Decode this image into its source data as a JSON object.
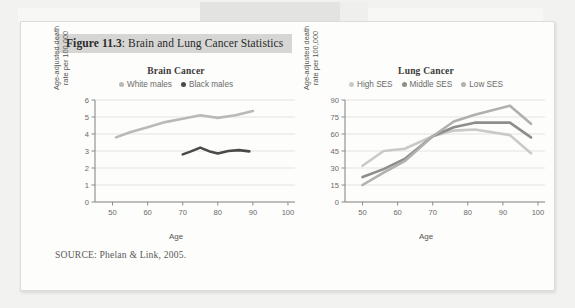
{
  "figure": {
    "label": "Figure 11.3",
    "title_prefix": "Figure 11.3",
    "title_rest": ": Brain and Lung Cancer Statistics",
    "source": "SOURCE: Phelan & Link, 2005."
  },
  "colors": {
    "white_males": "#b9b9b7",
    "black_males": "#4a4a4a",
    "high_ses": "#c9c9c6",
    "middle_ses": "#8d8d8b",
    "low_ses": "#b0b0ad",
    "grid": "#e3e3e0",
    "axis": "#8a8a86",
    "title_band": "#d6d6d4"
  },
  "charts": [
    {
      "id": "brain",
      "title": "Brain Cancer",
      "xlabel": "Age",
      "ylabel_line1": "Age-adjusted death",
      "ylabel_line2": "rate per 100,000",
      "xticks": [
        50,
        60,
        70,
        80,
        90,
        100
      ],
      "yticks": [
        0,
        1,
        2,
        3,
        4,
        5,
        6
      ],
      "xlim": [
        45,
        102
      ],
      "ylim": [
        0,
        6
      ],
      "legend": [
        {
          "label": "White males",
          "color": "#b9b9b7"
        },
        {
          "label": "Black males",
          "color": "#4a4a4a"
        }
      ]
    },
    {
      "id": "lung",
      "title": "Lung Cancer",
      "xlabel": "Age",
      "ylabel_line1": "Age-adjusted death",
      "ylabel_line2": "rate per 100,000",
      "xticks": [
        50,
        60,
        70,
        80,
        90,
        100
      ],
      "yticks": [
        0,
        15,
        30,
        45,
        60,
        75,
        90
      ],
      "xlim": [
        45,
        102
      ],
      "ylim": [
        0,
        90
      ],
      "legend": [
        {
          "label": "High SES",
          "color": "#c9c9c6"
        },
        {
          "label": "Middle SES",
          "color": "#8d8d8b"
        },
        {
          "label": "Low SES",
          "color": "#b0b0ad"
        }
      ]
    }
  ],
  "chart_data": [
    {
      "type": "line",
      "title": "Brain Cancer",
      "xlabel": "Age",
      "ylabel": "Age-adjusted death rate per 100,000",
      "xlim": [
        45,
        102
      ],
      "ylim": [
        0,
        6
      ],
      "xticks": [
        50,
        60,
        70,
        80,
        90,
        100
      ],
      "yticks": [
        0,
        1,
        2,
        3,
        4,
        5,
        6
      ],
      "grid": "horizontal",
      "legend_position": "top-center",
      "series": [
        {
          "name": "White males",
          "color": "#b9b9b7",
          "x": [
            51,
            55,
            60,
            65,
            70,
            75,
            80,
            85,
            90
          ],
          "values": [
            3.8,
            4.1,
            4.4,
            4.7,
            4.9,
            5.1,
            4.95,
            5.1,
            5.35
          ]
        },
        {
          "name": "Black males",
          "color": "#4a4a4a",
          "x": [
            70,
            72,
            75,
            78,
            80,
            83,
            86,
            89
          ],
          "values": [
            2.8,
            2.95,
            3.2,
            2.95,
            2.85,
            3.0,
            3.05,
            2.98
          ]
        }
      ]
    },
    {
      "type": "line",
      "title": "Lung Cancer",
      "xlabel": "Age",
      "ylabel": "Age-adjusted death rate per 100,000",
      "xlim": [
        45,
        102
      ],
      "ylim": [
        0,
        90
      ],
      "xticks": [
        50,
        60,
        70,
        80,
        90,
        100
      ],
      "yticks": [
        0,
        15,
        30,
        45,
        60,
        75,
        90
      ],
      "grid": "horizontal",
      "legend_position": "top-center",
      "series": [
        {
          "name": "High SES",
          "color": "#c9c9c6",
          "x": [
            50,
            56,
            62,
            70,
            76,
            82,
            92,
            98
          ],
          "values": [
            32,
            45,
            47,
            58,
            63,
            64,
            59,
            43
          ]
        },
        {
          "name": "Middle SES",
          "color": "#8d8d8b",
          "x": [
            50,
            56,
            62,
            70,
            76,
            82,
            92,
            98
          ],
          "values": [
            22,
            29,
            38,
            58,
            66,
            70,
            70,
            57
          ]
        },
        {
          "name": "Low SES",
          "color": "#b0b0ad",
          "x": [
            50,
            56,
            62,
            70,
            76,
            82,
            92,
            98
          ],
          "values": [
            15,
            26,
            36,
            58,
            71,
            77,
            85,
            69
          ]
        }
      ]
    }
  ]
}
